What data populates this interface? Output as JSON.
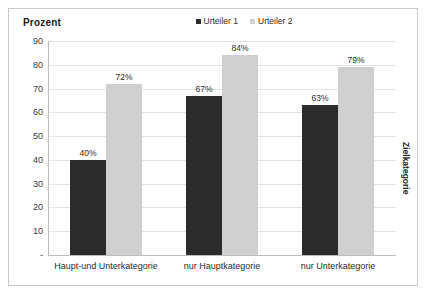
{
  "chart_data": {
    "type": "bar",
    "title": "",
    "ylabel": "Prozent",
    "xlabel": "Zielkategorie",
    "categories": [
      "Haupt-und Unterkategorie",
      "nur Hauptkategorie",
      "nur Unterkategorie"
    ],
    "series": [
      {
        "name": "Urteiler 1",
        "color": "#2b2b2b",
        "values": [
          40,
          67,
          63
        ],
        "labels": [
          "40%",
          "67%",
          "63%"
        ]
      },
      {
        "name": "Urteiler 2",
        "color": "#d0d0d0",
        "values": [
          72,
          84,
          79
        ],
        "labels": [
          "72%",
          "84%",
          "79%"
        ]
      }
    ],
    "ylim": [
      0,
      90
    ],
    "yticks": [
      0,
      10,
      20,
      30,
      40,
      50,
      60,
      70,
      80,
      90
    ],
    "ytick_labels": [
      "-",
      "10",
      "20",
      "30",
      "40",
      "50",
      "60",
      "70",
      "80",
      "90"
    ],
    "grid": true,
    "legend_position": "top-center"
  },
  "legend": {
    "entries": [
      {
        "label": "Urteiler 1",
        "color": "#2b2b2b"
      },
      {
        "label": "Urteiler 2",
        "color": "#d0d0d0"
      }
    ]
  },
  "colors": {
    "series_1": "#2b2b2b",
    "series_2": "#d0d0d0",
    "gridline": "#e3e3e3",
    "axis": "#bdbdbd",
    "frame": "#c9c9c9",
    "text": "#2b2b2b"
  }
}
